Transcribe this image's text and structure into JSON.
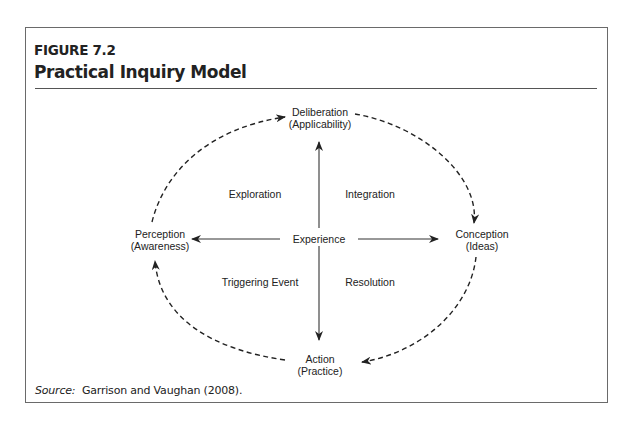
{
  "figure": {
    "number": "FIGURE 7.2",
    "title": "Practical Inquiry Model"
  },
  "nodes": {
    "top": {
      "line1": "Deliberation",
      "line2": "(Applicability)"
    },
    "right": {
      "line1": "Conception",
      "line2": "(Ideas)"
    },
    "bottom": {
      "line1": "Action",
      "line2": "(Practice)"
    },
    "left": {
      "line1": "Perception",
      "line2": "(Awareness)"
    },
    "center": "Experience"
  },
  "quadrants": {
    "top_left": "Exploration",
    "top_right": "Integration",
    "bottom_left": "Triggering Event",
    "bottom_right": "Resolution"
  },
  "source": {
    "label": "Source:",
    "text": "Garrison and Vaughan (2008)."
  },
  "colors": {
    "ink": "#222222",
    "frame": "#6a6a6a"
  }
}
